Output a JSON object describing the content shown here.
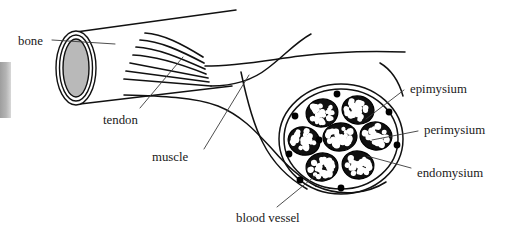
{
  "figure": {
    "type": "anatomical-diagram",
    "background_color": "#ffffff",
    "line_color": "#111111",
    "marrow_color": "#b9b9b9",
    "edge_artifact_color": "#a8a8a8"
  },
  "labels": {
    "bone": "bone",
    "tendon": "tendon",
    "muscle": "muscle",
    "blood_vessel": "blood vessel",
    "epimysium": "epimysium",
    "perimysium": "perimysium",
    "endomysium": "endomysium"
  },
  "cross_section": {
    "fascicle_count": 7,
    "blood_vessel_dot_count": 8,
    "fascicles": [
      {
        "cx": 322,
        "cy": 113,
        "rx": 16,
        "ry": 14,
        "rot": -12
      },
      {
        "cx": 358,
        "cy": 110,
        "rx": 16,
        "ry": 14,
        "rot": 10
      },
      {
        "cx": 304,
        "cy": 141,
        "rx": 16,
        "ry": 14,
        "rot": 18
      },
      {
        "cx": 340,
        "cy": 137,
        "rx": 17,
        "ry": 14,
        "rot": -5
      },
      {
        "cx": 376,
        "cy": 136,
        "rx": 16,
        "ry": 14,
        "rot": 8
      },
      {
        "cx": 322,
        "cy": 167,
        "rx": 16,
        "ry": 14,
        "rot": -8
      },
      {
        "cx": 358,
        "cy": 165,
        "rx": 16,
        "ry": 14,
        "rot": 12
      }
    ],
    "vessels": [
      {
        "cx": 337,
        "cy": 94,
        "r": 3.4
      },
      {
        "cx": 295,
        "cy": 116,
        "r": 3.4
      },
      {
        "cx": 389,
        "cy": 112,
        "r": 3.4
      },
      {
        "cx": 319,
        "cy": 140,
        "r": 3.4
      },
      {
        "cx": 289,
        "cy": 154,
        "r": 3.4
      },
      {
        "cx": 397,
        "cy": 145,
        "r": 3.4
      },
      {
        "cx": 300,
        "cy": 180,
        "r": 3.4
      },
      {
        "cx": 341,
        "cy": 188,
        "r": 3.4
      }
    ]
  }
}
